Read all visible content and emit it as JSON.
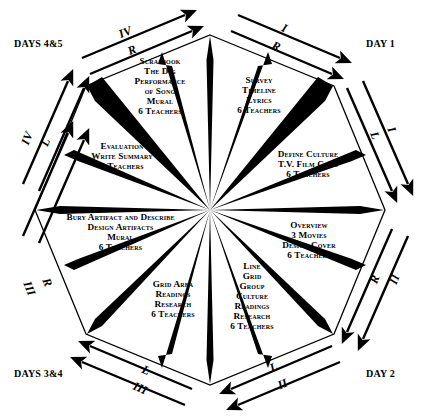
{
  "diagram": {
    "shape": "octagon",
    "colors": {
      "ink": "#000000",
      "paper": "#ffffff"
    },
    "corner_labels": [
      {
        "name": "days-4-5",
        "text": "DAYS 4&5"
      },
      {
        "name": "day-1",
        "text": "DAY 1"
      },
      {
        "name": "day-2",
        "text": "DAY 2"
      },
      {
        "name": "days-3-4",
        "text": "DAYS 3&4"
      }
    ],
    "sectors": [
      {
        "id": "scrapbook",
        "position": "top-left",
        "lines": [
          "Scrapbook",
          "The Dig",
          "Performance",
          "of Song",
          "Mural",
          "6 Teachers"
        ]
      },
      {
        "id": "survey",
        "position": "top-right",
        "lines": [
          "Survey",
          "Timeline",
          "Lyrics",
          "6 Teachers"
        ]
      },
      {
        "id": "define-culture",
        "position": "right-upper",
        "lines": [
          "Define Culture",
          "T.V. Film Clips",
          "6 Teachers"
        ]
      },
      {
        "id": "overview",
        "position": "right-lower",
        "lines": [
          "Overview",
          "3 Movies",
          "Design  Cover",
          "6 Teachers"
        ]
      },
      {
        "id": "line-grid",
        "position": "bottom-right",
        "lines": [
          "Line",
          "Grid",
          "Group",
          "Culture",
          "Readings",
          "Research",
          "6 Teachers"
        ]
      },
      {
        "id": "grid-area",
        "position": "bottom-left",
        "lines": [
          "Grid Area",
          "Readings",
          "Research",
          "6 Teachers"
        ]
      },
      {
        "id": "bury-artifact",
        "position": "left-lower",
        "lines": [
          "Bury Artifact and Describe",
          "Design Artifacts",
          "Mural",
          "6 Teachers"
        ]
      },
      {
        "id": "evaluation",
        "position": "left-upper",
        "lines": [
          "Evaluation",
          "Write Summary",
          "6 Teachers"
        ]
      }
    ],
    "arrows": [
      {
        "id": "top-left-outer",
        "roman": "IV",
        "letter": "R",
        "direction": "up-right"
      },
      {
        "id": "top-right-outer",
        "roman": "I",
        "letter": "R",
        "direction": "down-right"
      },
      {
        "id": "right-upper",
        "roman": "I",
        "letter": "L",
        "direction": "down-right"
      },
      {
        "id": "right-lower",
        "roman": "II",
        "letter": "R",
        "direction": "down-left"
      },
      {
        "id": "bottom-right",
        "roman": "II",
        "letter": "L",
        "direction": "down-left"
      },
      {
        "id": "bottom-left",
        "roman": "III",
        "letter": "L",
        "direction": "up-left"
      },
      {
        "id": "left-lower",
        "roman": "III",
        "letter": "R",
        "direction": "up-right"
      },
      {
        "id": "left-upper",
        "roman": "IV",
        "letter": "L",
        "direction": "up-right"
      }
    ]
  }
}
